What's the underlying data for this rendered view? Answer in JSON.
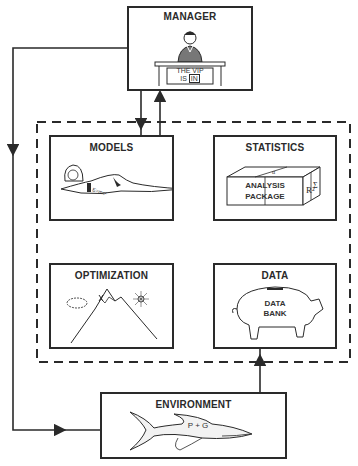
{
  "diagram": {
    "manager": {
      "title": "MANAGER",
      "sign_line1": "THE VIP",
      "sign_line2_prefix": "IS",
      "sign_line2_status": "IN"
    },
    "modules": [
      {
        "id": "models",
        "title": "MODELS",
        "sash_text": "E=mc²"
      },
      {
        "id": "statistics",
        "title": "STATISTICS",
        "package_line1": "ANALYSIS",
        "package_line2": "PACKAGE",
        "side_symbol_1": "R²",
        "side_symbol_2": "Σ",
        "top_symbol": "α"
      },
      {
        "id": "optimization",
        "title": "OPTIMIZATION"
      },
      {
        "id": "data",
        "title": "DATA",
        "bank_line1": "DATA",
        "bank_line2": "BANK"
      }
    ],
    "environment": {
      "title": "ENVIRONMENT",
      "fish_label": "P + G"
    },
    "colors": {
      "line": "#2a2a2a",
      "background": "#ffffff"
    }
  }
}
